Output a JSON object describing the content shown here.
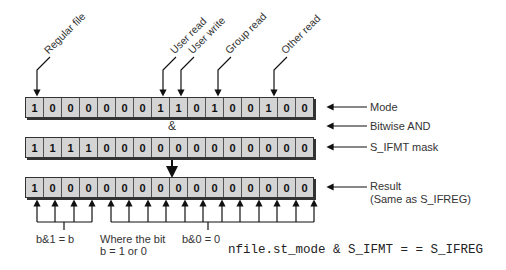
{
  "rows": {
    "mode": {
      "label": "Mode",
      "bits": [
        "1",
        "0",
        "0",
        "0",
        "0",
        "0",
        "0",
        "1",
        "1",
        "0",
        "1",
        "0",
        "0",
        "1",
        "0",
        "0"
      ]
    },
    "mask": {
      "label": "S_IFMT mask",
      "bits": [
        "1",
        "1",
        "1",
        "1",
        "0",
        "0",
        "0",
        "0",
        "0",
        "0",
        "0",
        "0",
        "0",
        "0",
        "0",
        "0"
      ]
    },
    "result": {
      "label": "Result",
      "sublabel": "(Same as S_IFREG)",
      "bits": [
        "1",
        "0",
        "0",
        "0",
        "0",
        "0",
        "0",
        "0",
        "0",
        "0",
        "0",
        "0",
        "0",
        "0",
        "0",
        "0"
      ]
    }
  },
  "operator": {
    "symbol": "&",
    "label": "Bitwise AND"
  },
  "callouts": {
    "regular_file": "Regular file",
    "user_read": "User read",
    "user_write": "User write",
    "group_read": "Group read",
    "other_read": "Other read"
  },
  "annotations": {
    "b_and_1": "b&1 = b",
    "where_line1": "Where the bit",
    "where_line2": "b = 1 or 0",
    "b_and_0": "b&0 = 0"
  },
  "code": "nfile.st_mode & S_IFMT = = S_IFREG"
}
